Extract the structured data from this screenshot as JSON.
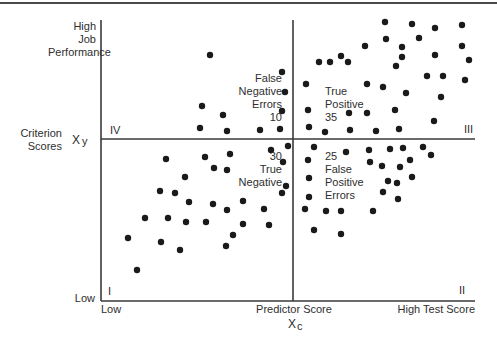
{
  "chart_data": {
    "type": "scatter",
    "title": "",
    "xlabel": "Predictor Score",
    "xlabel_symbol": "Xc",
    "ylabel": "Criterion Scores",
    "ylabel_symbol": "Xy",
    "x_axis": {
      "low_label": "Low",
      "high_label": "High Test Score",
      "center_label": "Predictor Score"
    },
    "y_axis": {
      "low_label": "Low",
      "high_label": [
        "High",
        "Job",
        "Performance"
      ]
    },
    "grid": false,
    "cutoffs": {
      "predictor_cutoff_px": 293,
      "criterion_cutoff_px": 139
    },
    "plot_area_px": {
      "left": 101,
      "top": 20,
      "right": 475,
      "bottom": 301
    },
    "quadrants": [
      {
        "id": "I",
        "position": "lower-left",
        "lines": [
          "30",
          "True",
          "Negative"
        ],
        "count": 30,
        "name": "True Negative"
      },
      {
        "id": "II",
        "position": "lower-right",
        "lines": [
          "25",
          "False",
          "Positive",
          "Errors"
        ],
        "count": 25,
        "name": "False Positive Errors"
      },
      {
        "id": "III",
        "position": "upper-right",
        "lines": [
          "True",
          "Positive",
          "35"
        ],
        "count": 35,
        "name": "True Positive"
      },
      {
        "id": "IV",
        "position": "upper-left",
        "lines": [
          "False",
          "Negative",
          "Errors",
          "10"
        ],
        "count": 10,
        "name": "False Negative Errors"
      }
    ],
    "points_px": [
      [
        210,
        55
      ],
      [
        282,
        72
      ],
      [
        285,
        92
      ],
      [
        202,
        106
      ],
      [
        223,
        115
      ],
      [
        282,
        111
      ],
      [
        200,
        128
      ],
      [
        227,
        131
      ],
      [
        260,
        130
      ],
      [
        280,
        129
      ],
      [
        319,
        62
      ],
      [
        341,
        56
      ],
      [
        365,
        46
      ],
      [
        385,
        22
      ],
      [
        412,
        24
      ],
      [
        386,
        39
      ],
      [
        419,
        38
      ],
      [
        402,
        47
      ],
      [
        435,
        28
      ],
      [
        462,
        25
      ],
      [
        402,
        57
      ],
      [
        435,
        55
      ],
      [
        469,
        60
      ],
      [
        462,
        46
      ],
      [
        330,
        62
      ],
      [
        348,
        62
      ],
      [
        396,
        66
      ],
      [
        427,
        76
      ],
      [
        443,
        76
      ],
      [
        465,
        80
      ],
      [
        306,
        84
      ],
      [
        367,
        84
      ],
      [
        406,
        93
      ],
      [
        383,
        87
      ],
      [
        441,
        97
      ],
      [
        395,
        110
      ],
      [
        308,
        110
      ],
      [
        349,
        113
      ],
      [
        367,
        113
      ],
      [
        434,
        121
      ],
      [
        309,
        127
      ],
      [
        325,
        132
      ],
      [
        350,
        130
      ],
      [
        376,
        131
      ],
      [
        399,
        129
      ],
      [
        166,
        159
      ],
      [
        205,
        157
      ],
      [
        214,
        168
      ],
      [
        230,
        154
      ],
      [
        227,
        170
      ],
      [
        271,
        150
      ],
      [
        288,
        146
      ],
      [
        283,
        162
      ],
      [
        185,
        177
      ],
      [
        160,
        191
      ],
      [
        175,
        193
      ],
      [
        189,
        202
      ],
      [
        213,
        204
      ],
      [
        243,
        201
      ],
      [
        264,
        209
      ],
      [
        227,
        210
      ],
      [
        282,
        193
      ],
      [
        286,
        186
      ],
      [
        145,
        218
      ],
      [
        168,
        218
      ],
      [
        186,
        222
      ],
      [
        206,
        222
      ],
      [
        243,
        224
      ],
      [
        233,
        235
      ],
      [
        269,
        225
      ],
      [
        161,
        242
      ],
      [
        180,
        250
      ],
      [
        226,
        246
      ],
      [
        137,
        270
      ],
      [
        128,
        238
      ],
      [
        314,
        147
      ],
      [
        308,
        160
      ],
      [
        346,
        152
      ],
      [
        369,
        150
      ],
      [
        390,
        149
      ],
      [
        403,
        148
      ],
      [
        423,
        147
      ],
      [
        431,
        155
      ],
      [
        370,
        162
      ],
      [
        382,
        166
      ],
      [
        400,
        167
      ],
      [
        410,
        160
      ],
      [
        309,
        178
      ],
      [
        388,
        181
      ],
      [
        397,
        183
      ],
      [
        412,
        177
      ],
      [
        383,
        192
      ],
      [
        398,
        199
      ],
      [
        309,
        197
      ],
      [
        305,
        209
      ],
      [
        326,
        211
      ],
      [
        341,
        211
      ],
      [
        373,
        211
      ],
      [
        314,
        230
      ],
      [
        341,
        234
      ]
    ],
    "colors": {
      "axis": "#3a3a3a",
      "point": "#1a1a1a",
      "text": "#2e2e2e"
    }
  },
  "labels": {
    "y_high": [
      "High",
      "Job",
      "Performance"
    ],
    "y_title": [
      "Criterion",
      "Scores"
    ],
    "y_symbol_main": "X",
    "y_symbol_sub": "y",
    "y_low": "Low",
    "x_low": "Low",
    "x_center": "Predictor Score",
    "x_high": "High Test Score",
    "x_symbol_main": "X",
    "x_symbol_sub": "c",
    "quad_I": "I",
    "quad_II": "II",
    "quad_III": "III",
    "quad_IV": "IV",
    "fn": [
      "False",
      "Negative",
      "Errors",
      "10"
    ],
    "tp": [
      "True",
      "Positive",
      "35"
    ],
    "tn": [
      "30",
      "True",
      "Negative"
    ],
    "fp": [
      "25",
      "False",
      "Positive",
      "Errors"
    ]
  }
}
